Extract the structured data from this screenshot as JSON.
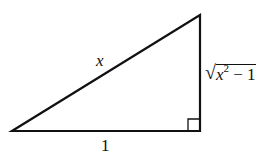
{
  "diagram": {
    "type": "right-triangle",
    "vertices": {
      "bottom_left": [
        12,
        131
      ],
      "bottom_right": [
        200,
        131
      ],
      "top": [
        200,
        15
      ]
    },
    "right_angle_marker": {
      "corner": "bottom_right",
      "size": 12
    },
    "stroke_color": "#111111",
    "labels": {
      "hypotenuse": "x",
      "base": "1",
      "vertical_side": {
        "radical": "√",
        "variable": "x",
        "exponent": "2",
        "rest": " − 1"
      }
    }
  }
}
